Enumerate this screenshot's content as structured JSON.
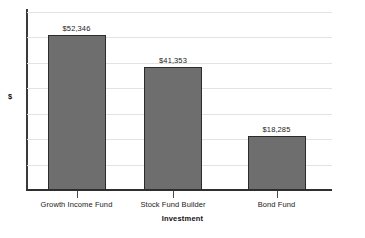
{
  "chart_data": {
    "type": "bar",
    "title": "",
    "xlabel": "Investment",
    "ylabel": "$",
    "categories": [
      "Growth Income Fund",
      "Stock Fund Builder",
      "Bond Fund"
    ],
    "values": [
      52346,
      41353,
      18285
    ],
    "value_labels": [
      "$52,346",
      "$41,353",
      "$18,285"
    ],
    "ylim": [
      0,
      60000
    ],
    "grid": true,
    "gridline_count": 7,
    "legend": "none",
    "bar_fill_color": "#6e6e6e",
    "bar_border_color": "#2b2b2b",
    "gridline_color": "#e3e3e3",
    "axis_color": "#2f2f2f",
    "text_color": "#1a1a1a",
    "background_color": "#ffffff"
  }
}
